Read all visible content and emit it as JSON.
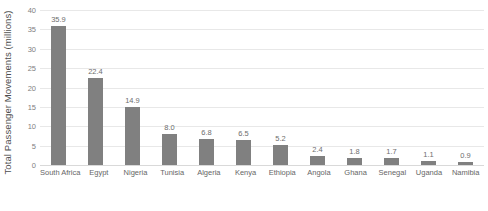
{
  "chart_data": {
    "type": "bar",
    "title": "",
    "subtitle": "",
    "xlabel": "",
    "ylabel": "Total Passenger Movements (millions)",
    "categories": [
      "South Africa",
      "Egypt",
      "Nigeria",
      "Tunisia",
      "Algeria",
      "Kenya",
      "Ethiopia",
      "Angola",
      "Ghana",
      "Senegal",
      "Uganda",
      "Namibia"
    ],
    "values": [
      35.9,
      22.4,
      14.9,
      8.0,
      6.8,
      6.5,
      5.2,
      2.4,
      1.8,
      1.7,
      1.1,
      0.9
    ],
    "data_labels": [
      "35.9",
      "22.4",
      "14.9",
      "8.0",
      "6.8",
      "6.5",
      "5.2",
      "2.4",
      "1.8",
      "1.7",
      "1.1",
      "0.9"
    ],
    "ylim": [
      0,
      40
    ],
    "ytick_values": [
      0,
      5,
      10,
      15,
      20,
      25,
      30,
      35,
      40
    ],
    "ytick_labels": [
      "0",
      "5",
      "10",
      "15",
      "20",
      "25",
      "30",
      "35",
      "40"
    ],
    "grid": "horizontal",
    "legend": "none",
    "orientation": "vertical",
    "bar_color": "#808080",
    "gridline_color": "#e8e8e8",
    "axis_text_color": "#808080",
    "label_text_color": "#666666",
    "background_color": "#ffffff"
  }
}
